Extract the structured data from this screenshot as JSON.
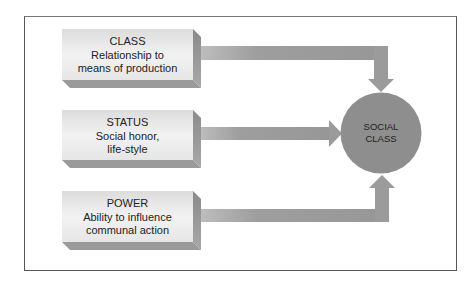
{
  "diagram": {
    "colors": {
      "box_face": "#e8e8e8",
      "box_shadow": "#9a9a9a",
      "arrow": "#9b9b9b",
      "circle": "#8e8e8e",
      "frame": "#555555",
      "text": "#222222"
    },
    "inputs": [
      {
        "title": "CLASS",
        "line1": "Relationship to",
        "line2": "means of production"
      },
      {
        "title": "STATUS",
        "line1": "Social honor,",
        "line2": "life-style"
      },
      {
        "title": "POWER",
        "line1": "Ability to influence",
        "line2": "communal action"
      }
    ],
    "outcome": {
      "line1": "SOCIAL",
      "line2": "CLASS"
    },
    "edges": [
      {
        "from": "CLASS",
        "to": "SOCIAL CLASS",
        "direction": "right-then-down"
      },
      {
        "from": "STATUS",
        "to": "SOCIAL CLASS",
        "direction": "right"
      },
      {
        "from": "POWER",
        "to": "SOCIAL CLASS",
        "direction": "right-then-up"
      }
    ]
  }
}
